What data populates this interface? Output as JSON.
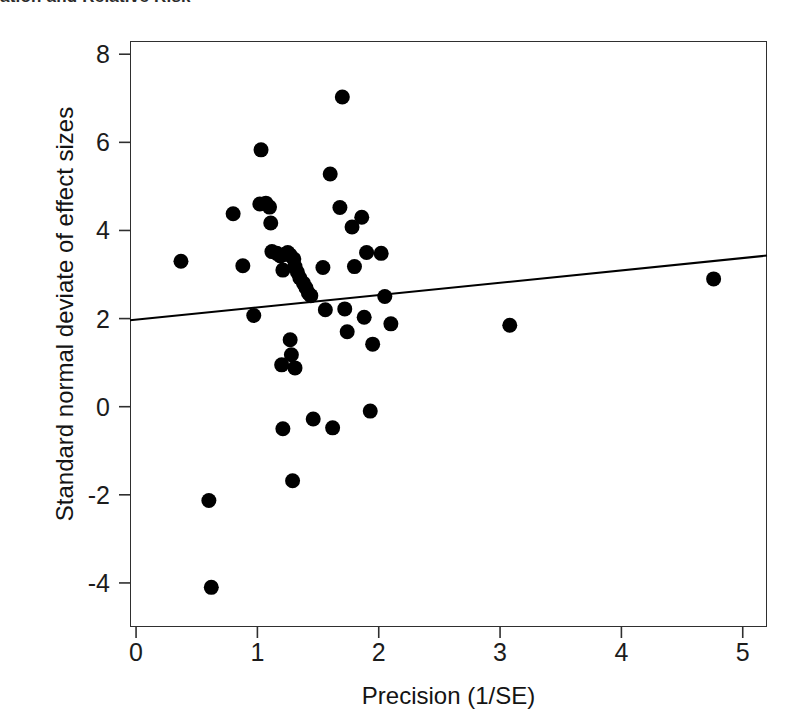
{
  "page": {
    "top_caption": "ation and Relative Risk",
    "background_color": "#ffffff",
    "ink_color": "#1a1a1a"
  },
  "chart_data": {
    "type": "scatter",
    "title": "",
    "xlabel": "Precision (1/SE)",
    "ylabel": "Standard normal deviate of effect sizes",
    "xlim": [
      -0.05,
      5.2
    ],
    "ylim": [
      -5.0,
      8.3
    ],
    "xticks": [
      0,
      1,
      2,
      3,
      4,
      5
    ],
    "xtick_labels": [
      "0",
      "1",
      "2",
      "3",
      "4",
      "5"
    ],
    "yticks": [
      -4,
      -2,
      0,
      2,
      4,
      6,
      8
    ],
    "ytick_labels": [
      "-4",
      "-2",
      "0",
      "2",
      "4",
      "6",
      "8"
    ],
    "grid": false,
    "legend": false,
    "marker": {
      "shape": "circle",
      "color": "#000000",
      "size_px": 15
    },
    "regression_line": {
      "name": "Egger regression line",
      "color": "#000000",
      "width_px": 2,
      "intercept": 1.97,
      "slope": 0.28,
      "x_start": -0.05,
      "x_end": 5.2,
      "y_start": 1.96,
      "y_end": 3.43
    },
    "points": [
      {
        "x": 0.37,
        "y": 3.3
      },
      {
        "x": 0.6,
        "y": -2.13
      },
      {
        "x": 0.62,
        "y": -4.1
      },
      {
        "x": 0.8,
        "y": 4.38
      },
      {
        "x": 0.88,
        "y": 3.2
      },
      {
        "x": 0.97,
        "y": 2.07
      },
      {
        "x": 1.02,
        "y": 4.6
      },
      {
        "x": 1.03,
        "y": 5.83
      },
      {
        "x": 1.07,
        "y": 4.62
      },
      {
        "x": 1.1,
        "y": 4.53
      },
      {
        "x": 1.11,
        "y": 4.17
      },
      {
        "x": 1.12,
        "y": 3.52
      },
      {
        "x": 1.16,
        "y": 3.48
      },
      {
        "x": 1.19,
        "y": 3.42
      },
      {
        "x": 1.21,
        "y": 3.1
      },
      {
        "x": 1.2,
        "y": 0.95
      },
      {
        "x": 1.21,
        "y": -0.5
      },
      {
        "x": 1.23,
        "y": 3.46
      },
      {
        "x": 1.25,
        "y": 3.5
      },
      {
        "x": 1.27,
        "y": 3.44
      },
      {
        "x": 1.27,
        "y": 1.52
      },
      {
        "x": 1.28,
        "y": 1.18
      },
      {
        "x": 1.29,
        "y": -1.68
      },
      {
        "x": 1.3,
        "y": 3.35
      },
      {
        "x": 1.31,
        "y": 3.18
      },
      {
        "x": 1.31,
        "y": 0.88
      },
      {
        "x": 1.33,
        "y": 3.05
      },
      {
        "x": 1.35,
        "y": 2.92
      },
      {
        "x": 1.38,
        "y": 2.8
      },
      {
        "x": 1.4,
        "y": 2.7
      },
      {
        "x": 1.42,
        "y": 2.58
      },
      {
        "x": 1.44,
        "y": 2.52
      },
      {
        "x": 1.46,
        "y": -0.28
      },
      {
        "x": 1.54,
        "y": 3.16
      },
      {
        "x": 1.56,
        "y": 2.2
      },
      {
        "x": 1.6,
        "y": 5.28
      },
      {
        "x": 1.62,
        "y": -0.48
      },
      {
        "x": 1.68,
        "y": 4.52
      },
      {
        "x": 1.7,
        "y": 7.03
      },
      {
        "x": 1.72,
        "y": 2.22
      },
      {
        "x": 1.74,
        "y": 1.7
      },
      {
        "x": 1.78,
        "y": 4.08
      },
      {
        "x": 1.8,
        "y": 3.18
      },
      {
        "x": 1.86,
        "y": 4.3
      },
      {
        "x": 1.88,
        "y": 2.03
      },
      {
        "x": 1.9,
        "y": 3.5
      },
      {
        "x": 1.93,
        "y": -0.1
      },
      {
        "x": 1.95,
        "y": 1.42
      },
      {
        "x": 2.02,
        "y": 3.48
      },
      {
        "x": 2.05,
        "y": 2.5
      },
      {
        "x": 2.1,
        "y": 1.88
      },
      {
        "x": 3.08,
        "y": 1.85
      },
      {
        "x": 4.76,
        "y": 2.9
      }
    ]
  }
}
